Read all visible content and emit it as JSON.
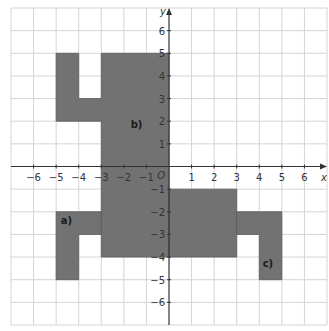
{
  "figure": {
    "x_axis_label": "x",
    "y_axis_label": "y",
    "origin_label": "O",
    "x_range": [
      -7,
      7
    ],
    "y_range": [
      -7,
      7
    ],
    "x_ticks": [
      {
        "v": -6,
        "label": "−6"
      },
      {
        "v": -5,
        "label": "−5"
      },
      {
        "v": -4,
        "label": "−4"
      },
      {
        "v": -3,
        "label": "−3"
      },
      {
        "v": -2,
        "label": "−2"
      },
      {
        "v": -1,
        "label": "−1"
      },
      {
        "v": 1,
        "label": "1"
      },
      {
        "v": 2,
        "label": "2"
      },
      {
        "v": 3,
        "label": "3"
      },
      {
        "v": 4,
        "label": "4"
      },
      {
        "v": 5,
        "label": "5"
      },
      {
        "v": 6,
        "label": "6"
      }
    ],
    "y_ticks": [
      {
        "v": 6,
        "label": "6"
      },
      {
        "v": 5,
        "label": "5"
      },
      {
        "v": 4,
        "label": "4"
      },
      {
        "v": 3,
        "label": "3"
      },
      {
        "v": 2,
        "label": "2"
      },
      {
        "v": 1,
        "label": "1"
      },
      {
        "v": -1,
        "label": "−1"
      },
      {
        "v": -2,
        "label": "−2"
      },
      {
        "v": -3,
        "label": "−3"
      },
      {
        "v": -4,
        "label": "−4"
      },
      {
        "v": -5,
        "label": "−5"
      },
      {
        "v": -6,
        "label": "−6"
      }
    ],
    "colors": {
      "shape_fill": "#727272",
      "shape_stroke": "#5a5a5a",
      "grid": "#d4d4d4",
      "axis": "#333333",
      "text": "#333333"
    },
    "shapes": [
      {
        "name": "shape-b",
        "label": "b)",
        "label_pos": [
          -1.7,
          1.7
        ],
        "points": [
          [
            -5,
            5
          ],
          [
            -4,
            5
          ],
          [
            -4,
            3
          ],
          [
            -3,
            3
          ],
          [
            -3,
            5
          ],
          [
            0,
            5
          ],
          [
            0,
            -4
          ],
          [
            -3,
            -4
          ],
          [
            -3,
            2
          ],
          [
            -5,
            2
          ]
        ]
      },
      {
        "name": "shape-b-lower-right",
        "label": "",
        "label_pos": null,
        "points": [
          [
            0,
            -1
          ],
          [
            3,
            -1
          ],
          [
            3,
            -4
          ],
          [
            0,
            -4
          ]
        ]
      },
      {
        "name": "shape-a",
        "label": "a)",
        "label_pos": [
          -4.8,
          -2.55
        ],
        "points": [
          [
            -5,
            -2
          ],
          [
            -3,
            -2
          ],
          [
            -3,
            -3
          ],
          [
            -4,
            -3
          ],
          [
            -4,
            -5
          ],
          [
            -5,
            -5
          ]
        ]
      },
      {
        "name": "shape-c",
        "label": "c)",
        "label_pos": [
          4.15,
          -4.45
        ],
        "points": [
          [
            3,
            -2
          ],
          [
            5,
            -2
          ],
          [
            5,
            -5
          ],
          [
            4,
            -5
          ],
          [
            4,
            -3
          ],
          [
            3,
            -3
          ]
        ]
      }
    ]
  }
}
